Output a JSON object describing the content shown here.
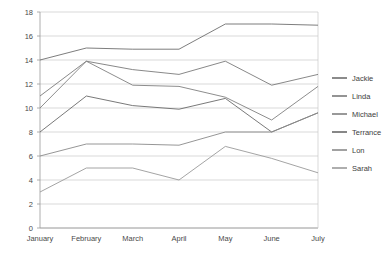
{
  "chart_data": {
    "type": "line",
    "title": "",
    "xlabel": "",
    "ylabel": "",
    "categories": [
      "January",
      "February",
      "March",
      "April",
      "May",
      "June",
      "July"
    ],
    "ylim": [
      0,
      18
    ],
    "yticks": [
      0,
      2,
      4,
      6,
      8,
      10,
      12,
      14,
      16,
      18
    ],
    "grid": true,
    "legend_position": "right",
    "series": [
      {
        "name": "Jackie",
        "color": "#6e6e6e",
        "values": [
          14.0,
          15.0,
          14.9,
          14.9,
          17.0,
          17.0,
          16.9
        ]
      },
      {
        "name": "Linda",
        "color": "#7a7a7a",
        "values": [
          11.0,
          13.9,
          13.2,
          12.8,
          13.9,
          11.9,
          12.8
        ]
      },
      {
        "name": "Michael",
        "color": "#808080",
        "values": [
          10.0,
          13.9,
          11.9,
          11.8,
          10.9,
          9.0,
          11.8
        ]
      },
      {
        "name": "Terrance",
        "color": "#6a6a6a",
        "values": [
          8.0,
          11.0,
          10.2,
          9.9,
          10.8,
          8.0,
          9.6
        ]
      },
      {
        "name": "Lon",
        "color": "#8a8a8a",
        "values": [
          6.0,
          7.0,
          7.0,
          6.9,
          8.0,
          8.0,
          9.6
        ]
      },
      {
        "name": "Sarah",
        "color": "#9a9a9a",
        "values": [
          3.0,
          5.0,
          5.0,
          4.0,
          6.8,
          5.8,
          4.6
        ]
      }
    ]
  },
  "legend": {
    "items": [
      {
        "label": "Jackie"
      },
      {
        "label": "Linda"
      },
      {
        "label": "Michael"
      },
      {
        "label": "Terrance"
      },
      {
        "label": "Lon"
      },
      {
        "label": "Sarah"
      }
    ]
  }
}
